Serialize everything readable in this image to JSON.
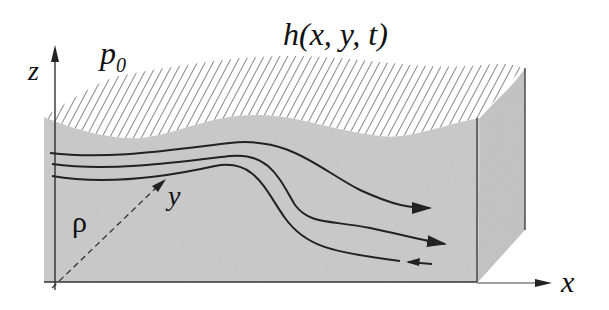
{
  "diagram": {
    "labels": {
      "surface_height": "h(x, y, t)",
      "surface_pressure_base": "p",
      "surface_pressure_sub": "0",
      "density": "ρ",
      "axis_x": "x",
      "axis_y": "y",
      "axis_z": "z"
    },
    "colors": {
      "fluid_fill": "#c9c9c9",
      "side_fill": "#c2c2c2",
      "hatch": "#555555",
      "line": "#222222",
      "background": "#ffffff"
    },
    "streamlines": [
      {
        "id": "upper",
        "direction": "right"
      },
      {
        "id": "middle",
        "direction": "right"
      },
      {
        "id": "lower",
        "direction": "left"
      }
    ]
  }
}
